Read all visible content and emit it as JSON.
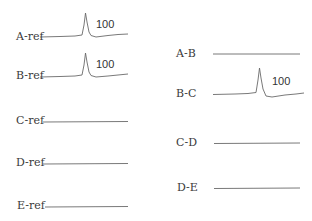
{
  "left_column": {
    "rows": [
      {
        "label": "A-ref",
        "peak": true,
        "peak_label": "100"
      },
      {
        "label": "B-ref",
        "peak": true,
        "peak_label": "100"
      },
      {
        "label": "C-ref",
        "peak": false
      },
      {
        "label": "D-ref",
        "peak": false
      },
      {
        "label": "E-ref",
        "peak": false
      }
    ]
  },
  "right_column": {
    "rows": [
      {
        "label": "A-B",
        "peak": false
      },
      {
        "label": "B-C",
        "peak": true,
        "peak_label": "100"
      },
      {
        "label": "C-D",
        "peak": false
      },
      {
        "label": "D-E",
        "peak": false
      }
    ]
  },
  "colors": {
    "trace": "#6a6a6a",
    "text": "#3a3a3a",
    "background": "#ffffff"
  }
}
